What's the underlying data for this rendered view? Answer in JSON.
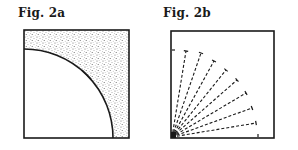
{
  "figures": [
    {
      "id": "fig-2a",
      "title": "Fig. 2a",
      "description": "Square with a quarter-circle arc centered at the bottom-left corner; region outside the arc is stippled; a tick mark crosses the arc.",
      "box": {
        "x": 24,
        "y": 30,
        "w": 105,
        "h": 108
      },
      "arc": {
        "cx": 24,
        "cy": 138,
        "r": 89
      },
      "tick": {
        "x1": 82,
        "y1": 70,
        "x2": 91,
        "y2": 79
      },
      "stipple_color": "#555555",
      "line_color": "#1a1a1a"
    },
    {
      "id": "fig-2b",
      "title": "Fig. 2b",
      "description": "Square with dashed rays radiating from the bottom-left corner; each ray ends in a small tick; tick marks on left and bottom edges.",
      "box": {
        "x": 171,
        "y": 31,
        "w": 103,
        "h": 107
      },
      "origin": {
        "x": 172,
        "y": 137
      },
      "rays": [
        {
          "x": 186,
          "y": 51
        },
        {
          "x": 201,
          "y": 53
        },
        {
          "x": 214,
          "y": 61
        },
        {
          "x": 226,
          "y": 70
        },
        {
          "x": 237,
          "y": 80
        },
        {
          "x": 246,
          "y": 93
        },
        {
          "x": 252,
          "y": 108
        },
        {
          "x": 256,
          "y": 123
        }
      ],
      "edge_ticks": [
        {
          "x1": 172,
          "y1": 50,
          "x2": 175,
          "y2": 50
        },
        {
          "x1": 258,
          "y1": 137,
          "x2": 258,
          "y2": 134
        }
      ],
      "line_color": "#1a1a1a"
    }
  ]
}
